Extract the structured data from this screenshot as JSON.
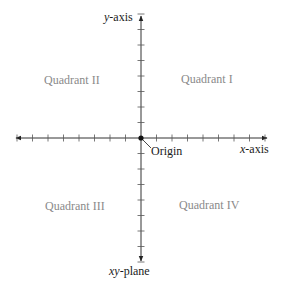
{
  "diagram": {
    "title": "xy-plane",
    "title_var": "xy",
    "title_rest": "-plane",
    "origin_label": "Origin",
    "x_axis": {
      "var": "x",
      "rest": "-axis",
      "full": "x-axis"
    },
    "y_axis": {
      "var": "y",
      "rest": "-axis",
      "full": "y-axis"
    },
    "quadrants": {
      "I": "Quadrant I",
      "II": "Quadrant II",
      "III": "Quadrant III",
      "IV": "Quadrant IV"
    },
    "colors": {
      "axis": "#333333",
      "quadrant_text": "#8a8a8a",
      "label_text": "#1a1a1a"
    },
    "geometry": {
      "origin": [
        141,
        138
      ],
      "x_axis_range_px": [
        14,
        268
      ],
      "y_axis_range_px": [
        14,
        263
      ],
      "tick_spacing_px": 15.5,
      "ticks_per_half_axis": 8
    }
  }
}
